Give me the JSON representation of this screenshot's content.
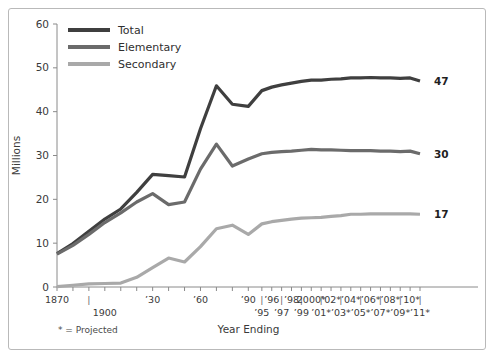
{
  "footnote": "* = Projected",
  "colors": {
    "total": "#3f3f3f",
    "elementary": "#6b6b6b",
    "secondary": "#a9a9a9",
    "axis": "#8a8a8a",
    "frame": "#b9b9b9",
    "text": "#3a3a3a"
  },
  "legend": {
    "items": [
      {
        "label": "Total",
        "color": "#3f3f3f"
      },
      {
        "label": "Elementary",
        "color": "#6b6b6b"
      },
      {
        "label": "Secondary",
        "color": "#a9a9a9"
      }
    ]
  },
  "end_labels": {
    "total": "47",
    "elementary": "30",
    "secondary": "17"
  },
  "chart_data": {
    "type": "line",
    "title": "",
    "xlabel": "Year Ending",
    "ylabel": "Millions",
    "ylim": [
      0,
      60
    ],
    "yticks": [
      0,
      10,
      20,
      30,
      40,
      50,
      60
    ],
    "ytick_labels": [
      "0",
      "10",
      "20",
      "30",
      "40",
      "50",
      "60"
    ],
    "grid": false,
    "legend_position": "top-left",
    "annotations": [
      "* = Projected"
    ],
    "x_axis_labels_row1": [
      "1870",
      "|",
      "’30",
      "’60",
      "’90",
      "|",
      "’96",
      "|",
      "’98",
      "|",
      "2000*",
      "|",
      "’02*",
      "|",
      "’04*",
      "|",
      "’06*",
      "|",
      "’08*",
      "|",
      "’10*",
      "|"
    ],
    "x_axis_labels_row2": [
      "1900",
      "’95",
      "’97",
      "’99",
      "’01*",
      "’03*",
      "’05*",
      "’07*",
      "’09*",
      "’11*"
    ],
    "x": [
      1870,
      1880,
      1890,
      1900,
      1910,
      1920,
      1930,
      1940,
      1950,
      1960,
      1970,
      1980,
      1990,
      1995,
      1996,
      1997,
      1998,
      1999,
      2000,
      2001,
      2002,
      2003,
      2004,
      2005,
      2006,
      2007,
      2008,
      2009,
      2010,
      2011
    ],
    "x_tick_years": [
      1870,
      1880,
      1890,
      1900,
      1910,
      1920,
      1930,
      1940,
      1950,
      1960,
      1970,
      1980,
      1990,
      1995,
      1996,
      1997,
      1998,
      1999,
      2000,
      2001,
      2002,
      2003,
      2004,
      2005,
      2006,
      2007,
      2008,
      2009,
      2010,
      2011
    ],
    "series": [
      {
        "name": "Total",
        "color": "#3f3f3f",
        "end_value": 47,
        "values": [
          7.6,
          9.9,
          12.7,
          15.5,
          17.8,
          21.6,
          25.7,
          25.4,
          25.1,
          36.1,
          45.9,
          41.7,
          41.2,
          44.8,
          45.6,
          46.1,
          46.5,
          46.9,
          47.2,
          47.2,
          47.4,
          47.5,
          47.7,
          47.7,
          47.8,
          47.7,
          47.7,
          47.6,
          47.7,
          47.0
        ]
      },
      {
        "name": "Elementary",
        "color": "#6b6b6b",
        "end_value": 30,
        "values": [
          7.5,
          9.5,
          12.0,
          14.7,
          16.9,
          19.4,
          21.3,
          18.8,
          19.4,
          26.9,
          32.6,
          27.6,
          29.2,
          30.4,
          30.7,
          30.9,
          31.0,
          31.2,
          31.4,
          31.3,
          31.3,
          31.2,
          31.1,
          31.1,
          31.1,
          31.0,
          31.0,
          30.9,
          31.0,
          30.4
        ]
      },
      {
        "name": "Secondary",
        "color": "#a9a9a9",
        "end_value": 17,
        "values": [
          0.1,
          0.4,
          0.7,
          0.8,
          0.9,
          2.2,
          4.4,
          6.6,
          5.7,
          9.2,
          13.3,
          14.1,
          12.0,
          14.4,
          14.9,
          15.2,
          15.5,
          15.7,
          15.8,
          15.9,
          16.1,
          16.3,
          16.6,
          16.6,
          16.7,
          16.7,
          16.7,
          16.7,
          16.7,
          16.6
        ]
      }
    ]
  }
}
